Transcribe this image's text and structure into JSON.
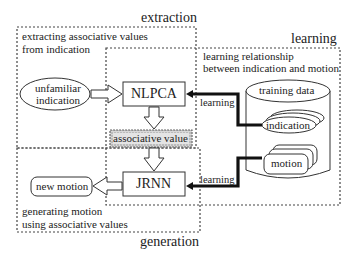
{
  "regions": {
    "extraction": {
      "title": "extraction",
      "description_line1": "extracting associative values",
      "description_line2": "from indication"
    },
    "learning": {
      "title": "learning",
      "description_line1": "learning relationship",
      "description_line2": "between indication and motion"
    },
    "generation": {
      "title": "generation",
      "description_line1": "generating motion",
      "description_line2": "using associative values"
    }
  },
  "nodes": {
    "unfamiliar_indication": {
      "line1": "unfamiliar",
      "line2": "indication"
    },
    "nlpca": "NLPCA",
    "associative_value": "associative value",
    "jrnn": "JRNN",
    "new_motion": "new motion",
    "training_data": "training data",
    "indication": "indication",
    "motion": "motion"
  },
  "edges": {
    "learning_top": "learning",
    "learning_bottom": "learning"
  },
  "colors": {
    "line": "#333333",
    "dashed": "#444444",
    "associative_value_fill": "#cfcfcf",
    "background": "#ffffff"
  }
}
